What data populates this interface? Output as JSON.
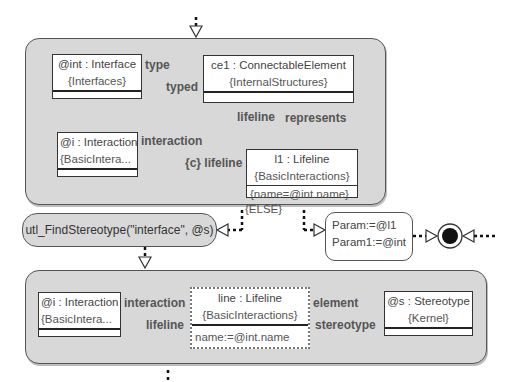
{
  "diagram": {
    "type": "story-diagram",
    "start_activity": {
      "shape": "hollow-triangle-down"
    },
    "top_story_pattern": {
      "objects": [
        {
          "id": "int",
          "title": "@int : Interface",
          "package": "{Interfaces}",
          "attributes": []
        },
        {
          "id": "ce1",
          "title": "ce1 : ConnectableElement",
          "package": "{InternalStructures}",
          "attributes": []
        },
        {
          "id": "i_top",
          "title": "@i : Interaction",
          "package": "{BasicIntera...",
          "attributes": []
        },
        {
          "id": "l1",
          "title": "l1 : Lifeline",
          "package": "{BasicInteractions}",
          "attributes": [
            "{name=@int.name}"
          ]
        }
      ],
      "links": [
        {
          "from": "int",
          "to": "ce1",
          "source_role": "type",
          "target_role": "typed"
        },
        {
          "from": "ce1",
          "to": "l1",
          "source_role": "lifeline",
          "target_role": "represents"
        },
        {
          "from": "i_top",
          "to": "l1",
          "source_role": "interaction",
          "target_role": "{c} lifeline"
        }
      ]
    },
    "else_guard": "{ELSE}",
    "statement_node": {
      "text": "utl_FindStereotype(\"interface\", @s)"
    },
    "param_node": {
      "lines": [
        "Param:=@l1",
        "Param1:=@int"
      ]
    },
    "stop_node": {
      "shape": "bullseye"
    },
    "bottom_story_pattern": {
      "objects": [
        {
          "id": "i_bot",
          "title": "@i : Interaction",
          "package": "{BasicIntera...",
          "attributes": []
        },
        {
          "id": "line",
          "title": "line : Lifeline",
          "package": "{BasicInteractions}",
          "attributes": [
            "name:=@int.name"
          ],
          "create": true
        },
        {
          "id": "s",
          "title": "@s : Stereotype",
          "package": "{Kernel}",
          "attributes": []
        }
      ],
      "links": [
        {
          "from": "i_bot",
          "to": "line",
          "source_role": "interaction",
          "target_role": "lifeline",
          "create": true
        },
        {
          "from": "line",
          "to": "s",
          "source_role": "element",
          "target_role": "stereotype",
          "create": true
        }
      ]
    }
  },
  "colors": {
    "story_fill": "#d8d8d8",
    "object_fill": "#ffffff",
    "border": "#333333",
    "label": "#555555"
  }
}
